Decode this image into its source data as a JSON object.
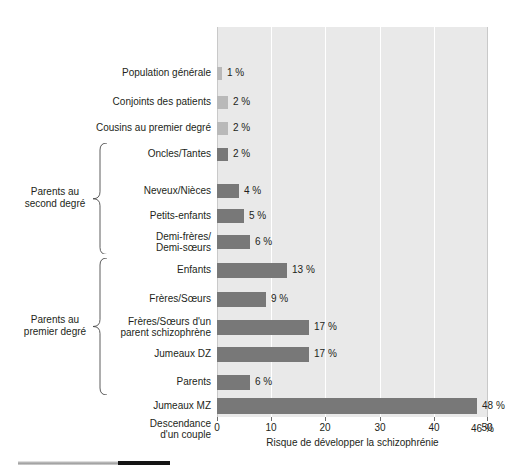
{
  "chart_data": {
    "type": "bar",
    "orientation": "horizontal",
    "title": "",
    "xlabel": "Risque de développer la schizophrénie",
    "ylabel": "",
    "xlim": [
      0,
      50
    ],
    "xticks": [
      0,
      10,
      20,
      30,
      40,
      50
    ],
    "xtick_labels": [
      "0",
      "10",
      "20",
      "30",
      "40",
      "50"
    ],
    "grid": true,
    "grid_axis": "x",
    "legend": null,
    "value_suffix": "%",
    "categories": [
      "Population générale",
      "Conjoints des patients",
      "Cousins au premier degré",
      "Oncles/Tantes",
      "Neveux/Nièces",
      "Petits-enfants",
      "Demi-frères/\nDemi-sœurs",
      "Enfants",
      "Frères/Sœurs",
      "Frères/Sœurs d'un\nparent schizophrène",
      "Jumeaux DZ",
      "Parents",
      "Jumeaux MZ",
      "Descendance\nd'un couple"
    ],
    "values": [
      1,
      2,
      2,
      2,
      4,
      5,
      6,
      13,
      9,
      17,
      17,
      6,
      48,
      46
    ],
    "value_labels": [
      "1 %",
      "2 %",
      "2 %",
      "2 %",
      "4 %",
      "5 %",
      "6 %",
      "13 %",
      "9 %",
      "17 %",
      "17 %",
      "6 %",
      "48 %",
      "46 %"
    ],
    "bar_shades": [
      "light",
      "light",
      "light",
      "dark",
      "dark",
      "dark",
      "dark",
      "dark",
      "dark",
      "dark",
      "dark",
      "dark",
      "dark",
      "dark"
    ],
    "colors": {
      "bar_dark": "#787878",
      "bar_light": "#b9b9b9",
      "plot_background": "#e9e9e9",
      "gridline": "#ffffff",
      "text": "#231f20"
    },
    "groups": [
      {
        "label": "Parents au\nsecond degré",
        "first_index": 3,
        "last_index": 6
      },
      {
        "label": "Parents au\npremier degré",
        "first_index": 7,
        "last_index": 11
      }
    ]
  }
}
